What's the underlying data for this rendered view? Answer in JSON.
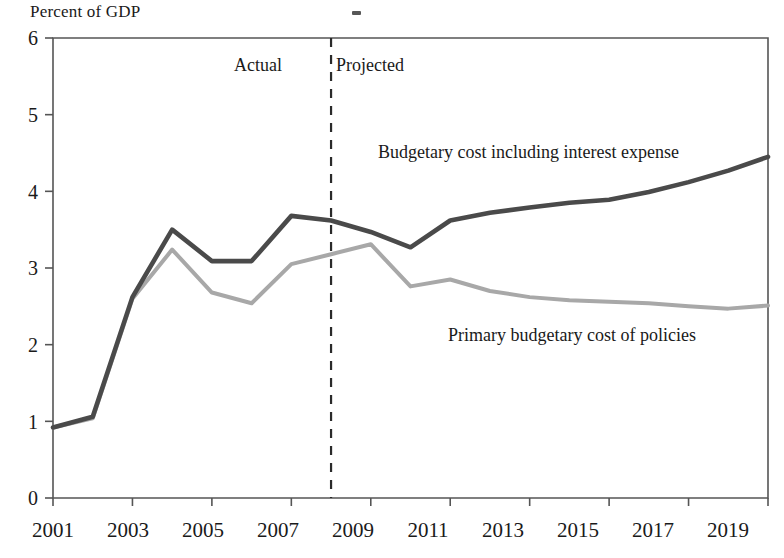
{
  "chart_data": {
    "type": "line",
    "title": "",
    "ylabel": "Percent of GDP",
    "xlabel": "",
    "x": [
      2001,
      2002,
      2003,
      2004,
      2005,
      2006,
      2007,
      2008,
      2009,
      2010,
      2011,
      2012,
      2013,
      2014,
      2015,
      2016,
      2017,
      2018,
      2019
    ],
    "xlim": [
      2001,
      2019
    ],
    "ylim": [
      0,
      6
    ],
    "grid": false,
    "legend_position": "inline-annotation",
    "yticks": [
      "0",
      "1",
      "2",
      "3",
      "4",
      "5",
      "6"
    ],
    "ytick_values": [
      0,
      1,
      2,
      3,
      4,
      5,
      6
    ],
    "xticks": [
      "2001",
      "2003",
      "2005",
      "2007",
      "2009",
      "2011",
      "2013",
      "2015",
      "2017",
      "2019"
    ],
    "xtick_values": [
      2001,
      2003,
      2005,
      2007,
      2009,
      2011,
      2013,
      2015,
      2017,
      2019
    ],
    "series": [
      {
        "name": "Budgetary cost including interest expense",
        "color": "#4a4a4a",
        "values": [
          0.92,
          1.06,
          2.62,
          3.5,
          3.09,
          3.09,
          3.68,
          3.62,
          3.47,
          3.27,
          3.62,
          3.72,
          3.79,
          3.85,
          3.89,
          3.99,
          4.12,
          4.27,
          4.45
        ]
      },
      {
        "name": "Primary budgetary cost of policies",
        "color": "#a8a8a8",
        "values": [
          0.92,
          1.04,
          2.6,
          3.24,
          2.68,
          2.54,
          3.05,
          3.18,
          3.31,
          2.76,
          2.85,
          2.7,
          2.62,
          2.58,
          2.56,
          2.54,
          2.5,
          2.47,
          2.51
        ]
      }
    ],
    "annotations": [
      {
        "text": "Actual",
        "x": 2005.9,
        "y": 5.45
      },
      {
        "text": "Projected",
        "x": 2008.3,
        "y": 5.45
      },
      {
        "text": "Budgetary cost including interest expense",
        "x": 2009.7,
        "y": 4.58
      },
      {
        "text": "Primary budgetary cost of policies",
        "x": 2011.3,
        "y": 2.22
      }
    ],
    "divider": {
      "x": 2008,
      "style": "dashed",
      "color": "#2a2a2a"
    }
  },
  "labels": {
    "y_axis_title": "Percent of GDP",
    "actual": "Actual",
    "projected": "Projected",
    "series_dark": "Budgetary cost including interest expense",
    "series_light": "Primary budgetary cost of policies",
    "y0": "0",
    "y1": "1",
    "y2": "2",
    "y3": "3",
    "y4": "4",
    "y5": "5",
    "y6": "6",
    "x2001": "2001",
    "x2003": "2003",
    "x2005": "2005",
    "x2007": "2007",
    "x2009": "2009",
    "x2011": "2011",
    "x2013": "2013",
    "x2015": "2015",
    "x2017": "2017",
    "x2019": "2019"
  },
  "colors": {
    "dark_series": "#4a4a4a",
    "light_series": "#a8a8a8",
    "axis": "#555555",
    "divider": "#2a2a2a",
    "text": "#1a1a1a"
  }
}
